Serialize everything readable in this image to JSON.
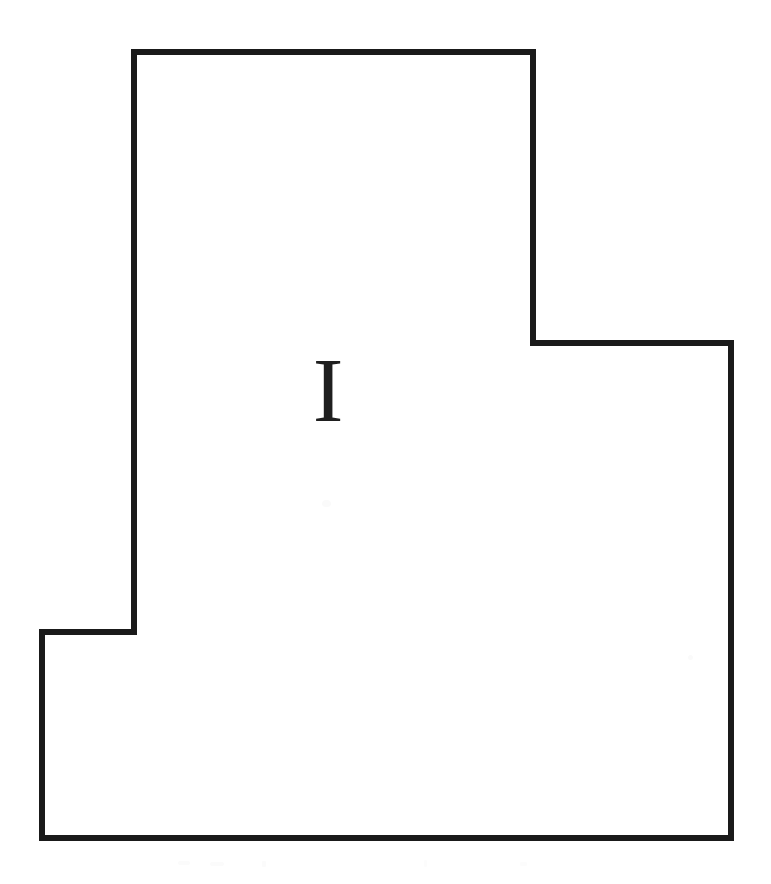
{
  "document": {
    "title": "Architectural Outline Drawing",
    "background_color": "#ffffff",
    "width": 771,
    "height": 884
  },
  "figure": {
    "name": "rectilinear-outline-polygon",
    "stroke_color": "#1a1a1a",
    "stroke_width": 6.5,
    "fill_color": "none",
    "vertices": [
      {
        "x": 134,
        "y": 52
      },
      {
        "x": 533,
        "y": 52
      },
      {
        "x": 533,
        "y": 343
      },
      {
        "x": 731,
        "y": 343
      },
      {
        "x": 731,
        "y": 838
      },
      {
        "x": 42,
        "y": 838
      },
      {
        "x": 42,
        "y": 632
      },
      {
        "x": 134,
        "y": 632
      }
    ],
    "path": "M 134 52 L 533 52 L 533 343 L 731 343 L 731 838 L 42 838 L 42 632 L 134 632 Z"
  },
  "annotation": {
    "name": "interior-letter-label",
    "text": "I",
    "color": "#1f1f1f",
    "font_size_px": 92,
    "center_x": 328,
    "center_y": 390,
    "bounds": {
      "left": 308,
      "top": 358,
      "right": 348,
      "bottom": 423
    }
  },
  "artifacts": {
    "description": "Faint scanner speckles, not content",
    "count": 7
  }
}
